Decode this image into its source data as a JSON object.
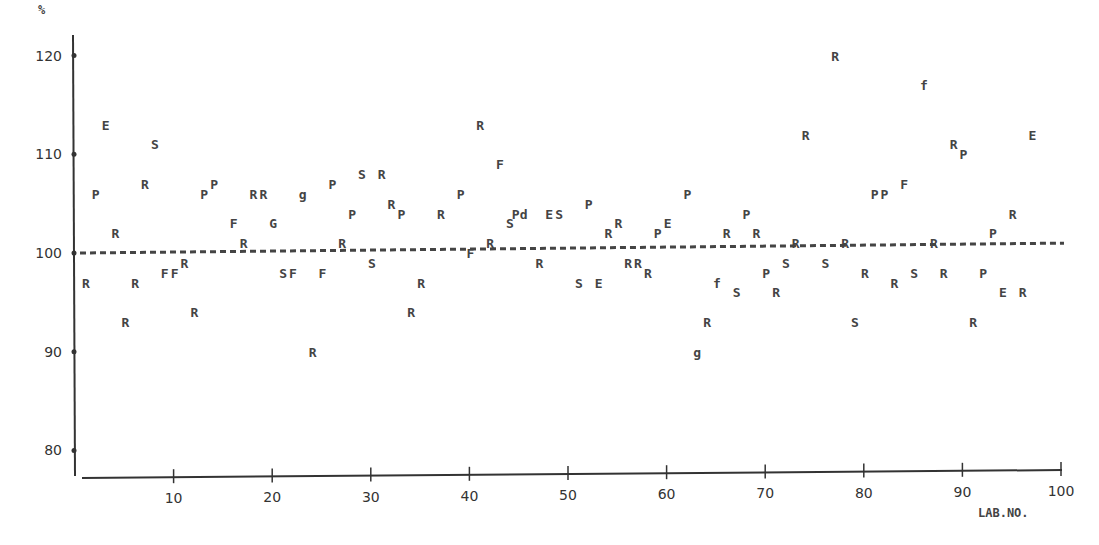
{
  "chart_data": {
    "type": "scatter",
    "title": "",
    "xlabel": "LAB.NO.",
    "ylabel": "%",
    "xlim": [
      0,
      100
    ],
    "ylim": [
      77,
      122
    ],
    "xticks": [
      10,
      20,
      30,
      40,
      50,
      60,
      70,
      80,
      90,
      100
    ],
    "yticks": [
      80,
      90,
      100,
      110,
      120
    ],
    "grid": false,
    "reference_line": {
      "type": "dashed",
      "y_start": 100.0,
      "y_end": 101.0,
      "x_start": 0,
      "x_end": 100
    },
    "marker_legend_note": "Data points are plotted as letter codes (R, P, F, S, E, G, Pd, f, g)",
    "points": [
      {
        "lab": 1,
        "value": 97,
        "marker": "R"
      },
      {
        "lab": 2,
        "value": 106,
        "marker": "P"
      },
      {
        "lab": 3,
        "value": 113,
        "marker": "E"
      },
      {
        "lab": 4,
        "value": 102,
        "marker": "R"
      },
      {
        "lab": 5,
        "value": 93,
        "marker": "R"
      },
      {
        "lab": 6,
        "value": 97,
        "marker": "R"
      },
      {
        "lab": 7,
        "value": 107,
        "marker": "R"
      },
      {
        "lab": 8,
        "value": 111,
        "marker": "S"
      },
      {
        "lab": 9,
        "value": 98,
        "marker": "F"
      },
      {
        "lab": 10,
        "value": 98,
        "marker": "F"
      },
      {
        "lab": 11,
        "value": 99,
        "marker": "R"
      },
      {
        "lab": 12,
        "value": 94,
        "marker": "R"
      },
      {
        "lab": 13,
        "value": 106,
        "marker": "P"
      },
      {
        "lab": 14,
        "value": 107,
        "marker": "P"
      },
      {
        "lab": 16,
        "value": 103,
        "marker": "F"
      },
      {
        "lab": 17,
        "value": 101,
        "marker": "R"
      },
      {
        "lab": 18,
        "value": 106,
        "marker": "R"
      },
      {
        "lab": 19,
        "value": 106,
        "marker": "R"
      },
      {
        "lab": 20,
        "value": 103,
        "marker": "G"
      },
      {
        "lab": 21,
        "value": 98,
        "marker": "S"
      },
      {
        "lab": 22,
        "value": 98,
        "marker": "F"
      },
      {
        "lab": 23,
        "value": 106,
        "marker": "g"
      },
      {
        "lab": 24,
        "value": 90,
        "marker": "R"
      },
      {
        "lab": 25,
        "value": 98,
        "marker": "F"
      },
      {
        "lab": 26,
        "value": 107,
        "marker": "P"
      },
      {
        "lab": 27,
        "value": 101,
        "marker": "R"
      },
      {
        "lab": 28,
        "value": 104,
        "marker": "P"
      },
      {
        "lab": 29,
        "value": 108,
        "marker": "S"
      },
      {
        "lab": 30,
        "value": 99,
        "marker": "S"
      },
      {
        "lab": 31,
        "value": 108,
        "marker": "R"
      },
      {
        "lab": 32,
        "value": 105,
        "marker": "R"
      },
      {
        "lab": 33,
        "value": 104,
        "marker": "P"
      },
      {
        "lab": 34,
        "value": 94,
        "marker": "R"
      },
      {
        "lab": 35,
        "value": 97,
        "marker": "R"
      },
      {
        "lab": 37,
        "value": 104,
        "marker": "R"
      },
      {
        "lab": 39,
        "value": 106,
        "marker": "P"
      },
      {
        "lab": 40,
        "value": 100,
        "marker": "F"
      },
      {
        "lab": 41,
        "value": 113,
        "marker": "R"
      },
      {
        "lab": 42,
        "value": 101,
        "marker": "R"
      },
      {
        "lab": 43,
        "value": 109,
        "marker": "F"
      },
      {
        "lab": 44,
        "value": 103,
        "marker": "S"
      },
      {
        "lab": 45,
        "value": 104,
        "marker": "Pd"
      },
      {
        "lab": 47,
        "value": 99,
        "marker": "R"
      },
      {
        "lab": 48,
        "value": 104,
        "marker": "E"
      },
      {
        "lab": 49,
        "value": 104,
        "marker": "S"
      },
      {
        "lab": 51,
        "value": 97,
        "marker": "S"
      },
      {
        "lab": 52,
        "value": 105,
        "marker": "P"
      },
      {
        "lab": 53,
        "value": 97,
        "marker": "E"
      },
      {
        "lab": 54,
        "value": 102,
        "marker": "R"
      },
      {
        "lab": 55,
        "value": 103,
        "marker": "R"
      },
      {
        "lab": 56,
        "value": 99,
        "marker": "R"
      },
      {
        "lab": 57,
        "value": 99,
        "marker": "R"
      },
      {
        "lab": 58,
        "value": 98,
        "marker": "R"
      },
      {
        "lab": 59,
        "value": 102,
        "marker": "P"
      },
      {
        "lab": 60,
        "value": 103,
        "marker": "E"
      },
      {
        "lab": 62,
        "value": 106,
        "marker": "P"
      },
      {
        "lab": 63,
        "value": 90,
        "marker": "g"
      },
      {
        "lab": 64,
        "value": 93,
        "marker": "R"
      },
      {
        "lab": 65,
        "value": 97,
        "marker": "f"
      },
      {
        "lab": 66,
        "value": 102,
        "marker": "R"
      },
      {
        "lab": 67,
        "value": 96,
        "marker": "S"
      },
      {
        "lab": 68,
        "value": 104,
        "marker": "P"
      },
      {
        "lab": 69,
        "value": 102,
        "marker": "R"
      },
      {
        "lab": 70,
        "value": 98,
        "marker": "P"
      },
      {
        "lab": 71,
        "value": 96,
        "marker": "R"
      },
      {
        "lab": 72,
        "value": 99,
        "marker": "S"
      },
      {
        "lab": 73,
        "value": 101,
        "marker": "R"
      },
      {
        "lab": 74,
        "value": 112,
        "marker": "R"
      },
      {
        "lab": 76,
        "value": 99,
        "marker": "S"
      },
      {
        "lab": 77,
        "value": 120,
        "marker": "R"
      },
      {
        "lab": 78,
        "value": 101,
        "marker": "R"
      },
      {
        "lab": 79,
        "value": 93,
        "marker": "S"
      },
      {
        "lab": 80,
        "value": 98,
        "marker": "R"
      },
      {
        "lab": 81,
        "value": 106,
        "marker": "P"
      },
      {
        "lab": 82,
        "value": 106,
        "marker": "P"
      },
      {
        "lab": 83,
        "value": 97,
        "marker": "R"
      },
      {
        "lab": 84,
        "value": 107,
        "marker": "F"
      },
      {
        "lab": 85,
        "value": 98,
        "marker": "S"
      },
      {
        "lab": 86,
        "value": 117,
        "marker": "f"
      },
      {
        "lab": 87,
        "value": 101,
        "marker": "R"
      },
      {
        "lab": 88,
        "value": 98,
        "marker": "R"
      },
      {
        "lab": 89,
        "value": 111,
        "marker": "R"
      },
      {
        "lab": 90,
        "value": 110,
        "marker": "P"
      },
      {
        "lab": 91,
        "value": 93,
        "marker": "R"
      },
      {
        "lab": 92,
        "value": 98,
        "marker": "P"
      },
      {
        "lab": 93,
        "value": 102,
        "marker": "P"
      },
      {
        "lab": 94,
        "value": 96,
        "marker": "E"
      },
      {
        "lab": 95,
        "value": 104,
        "marker": "R"
      },
      {
        "lab": 96,
        "value": 96,
        "marker": "R"
      },
      {
        "lab": 97,
        "value": 112,
        "marker": "E"
      }
    ]
  },
  "labels": {
    "y_unit": "%",
    "x_title": "LAB.NO."
  }
}
